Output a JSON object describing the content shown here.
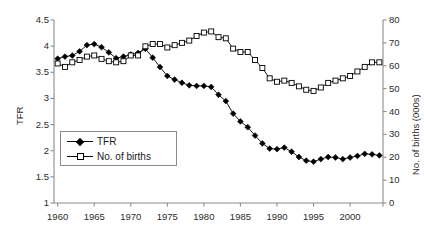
{
  "chart_data": {
    "type": "line",
    "title": "",
    "xlabel": "",
    "ylabel": "TFR",
    "y2label": "No. of births (000s)",
    "grid": false,
    "legend_position": "inside-left",
    "xlim": [
      1959.5,
      2004.5
    ],
    "ylim": [
      1,
      4.5
    ],
    "y2lim": [
      0,
      80
    ],
    "xticks": [
      1960,
      1965,
      1970,
      1975,
      1980,
      1985,
      1990,
      1995,
      2000
    ],
    "xtick_labels": [
      "1960",
      "1965",
      "1970",
      "1975",
      "1980",
      "1985",
      "1990",
      "1995",
      "2000"
    ],
    "xticks_minor": [
      1960,
      1965,
      1970,
      1975,
      1980,
      1985,
      1990,
      1995,
      2000,
      2004.5
    ],
    "yticks": [
      1,
      1.5,
      2,
      2.5,
      3,
      3.5,
      4,
      4.5
    ],
    "ytick_labels": [
      "1",
      "1.5",
      "2",
      "2.5",
      "3",
      "3.5",
      "4",
      "4.5"
    ],
    "y2ticks": [
      0,
      10,
      20,
      30,
      40,
      50,
      60,
      70,
      80
    ],
    "y2tick_labels": [
      "0",
      "10",
      "20",
      "30",
      "40",
      "50",
      "60",
      "70",
      "80"
    ],
    "x": [
      1960,
      1961,
      1962,
      1963,
      1964,
      1965,
      1966,
      1967,
      1968,
      1969,
      1970,
      1971,
      1972,
      1973,
      1974,
      1975,
      1976,
      1977,
      1978,
      1979,
      1980,
      1981,
      1982,
      1983,
      1984,
      1985,
      1986,
      1987,
      1988,
      1989,
      1990,
      1991,
      1992,
      1993,
      1994,
      1995,
      1996,
      1997,
      1998,
      1999,
      2000,
      2001,
      2002,
      2003,
      2004
    ],
    "series": [
      {
        "name": "TFR",
        "axis": "left",
        "marker": "filled-diamond",
        "color": "#000000",
        "values": [
          3.76,
          3.8,
          3.82,
          3.9,
          4.02,
          4.04,
          3.98,
          3.88,
          3.77,
          3.8,
          3.84,
          3.87,
          3.95,
          3.78,
          3.6,
          3.43,
          3.36,
          3.3,
          3.25,
          3.24,
          3.24,
          3.22,
          3.07,
          2.95,
          2.71,
          2.56,
          2.45,
          2.29,
          2.14,
          2.04,
          2.03,
          2.06,
          1.98,
          1.88,
          1.81,
          1.79,
          1.84,
          1.88,
          1.87,
          1.84,
          1.87,
          1.9,
          1.94,
          1.93,
          1.91
        ]
      },
      {
        "name": "No. of births",
        "axis": "right",
        "marker": "open-square",
        "color": "#000000",
        "values": [
          61.0,
          59.5,
          61.5,
          62.5,
          64.0,
          64.5,
          63.0,
          62.0,
          61.5,
          62.0,
          64.5,
          64.5,
          68.5,
          69.5,
          69.5,
          68.0,
          69.0,
          70.0,
          71.0,
          73.0,
          74.5,
          75.0,
          72.5,
          72.0,
          67.5,
          66.0,
          66.0,
          62.5,
          59.0,
          54.5,
          53.0,
          53.5,
          52.5,
          51.0,
          49.5,
          49.0,
          50.5,
          52.5,
          53.5,
          54.5,
          55.5,
          57.5,
          59.5,
          61.5,
          61.5
        ]
      }
    ],
    "legend": [
      {
        "label": "TFR",
        "marker": "filled-diamond"
      },
      {
        "label": "No. of births",
        "marker": "open-square"
      }
    ]
  }
}
